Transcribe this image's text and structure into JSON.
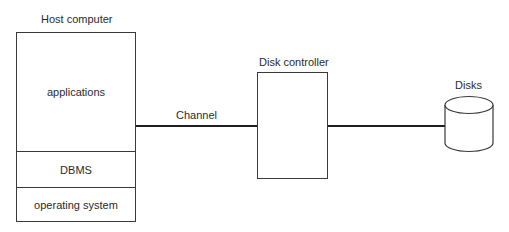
{
  "diagram": {
    "type": "architecture",
    "host": {
      "title": "Host computer",
      "layers": [
        {
          "label": "applications"
        },
        {
          "label": "DBMS"
        },
        {
          "label": "operating system"
        }
      ]
    },
    "channel": {
      "label": "Channel"
    },
    "controller": {
      "title": "Disk controller"
    },
    "disks": {
      "title": "Disks",
      "icon": "cylinder-icon"
    },
    "connections": [
      {
        "from": "host",
        "to": "controller",
        "label": "Channel"
      },
      {
        "from": "controller",
        "to": "disks",
        "label": ""
      }
    ],
    "colors": {
      "line": "#1e1e1e",
      "border": "#3a3a3a",
      "text": "#2b2b2b",
      "background": "#ffffff"
    }
  }
}
